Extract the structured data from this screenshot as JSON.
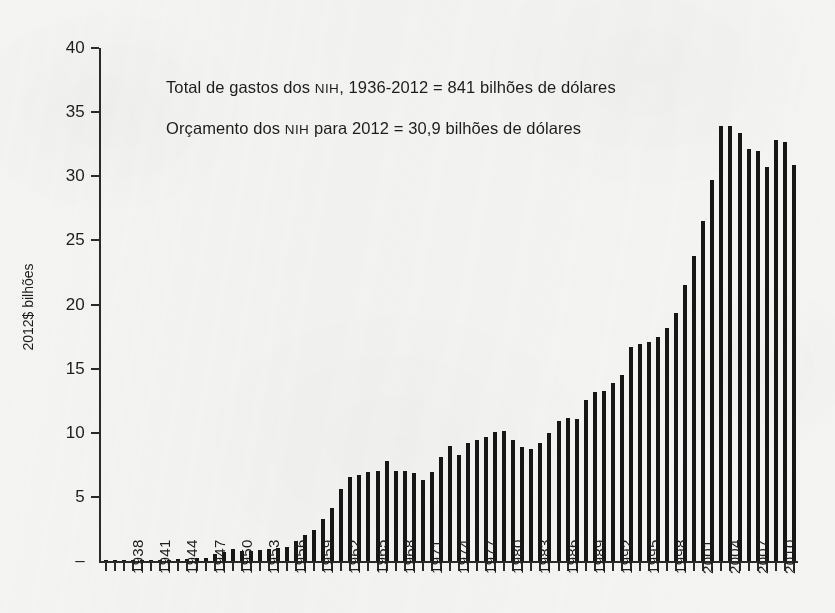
{
  "figure": {
    "background_color": "#f4f4f2",
    "ink_color": "#161616"
  },
  "annotations": {
    "total": {
      "prefix": "Total de gastos dos ",
      "acronym": "NIH",
      "suffix": ", 1936-2012 = 841 bilhões de dólares"
    },
    "budget": {
      "prefix": "Orçamento dos ",
      "acronym": "NIH",
      "suffix": " para 2012 = 30,9 bilhões de dólares"
    }
  },
  "chart_data": {
    "type": "bar",
    "title": "",
    "subtitle": "",
    "xlabel": "",
    "ylabel": "2012$ bilhões",
    "ylim": [
      0,
      40
    ],
    "ytick_values": [
      0,
      5,
      10,
      15,
      20,
      25,
      30,
      35,
      40
    ],
    "ytick_labels": [
      "–",
      "5",
      "10",
      "15",
      "20",
      "25",
      "30",
      "35",
      "40"
    ],
    "grid": false,
    "legend": null,
    "xtick_label_interval": 3,
    "xtick_labels_shown": [
      "1938",
      "1941",
      "1944",
      "1947",
      "1950",
      "1953",
      "1956",
      "1959",
      "1962",
      "1965",
      "1968",
      "1971",
      "1974",
      "1977",
      "1980",
      "1983",
      "1986",
      "1989",
      "1992",
      "1995",
      "1998",
      "2001",
      "2004",
      "2007",
      "2010"
    ],
    "categories": [
      "1936",
      "1937",
      "1938",
      "1939",
      "1940",
      "1941",
      "1942",
      "1943",
      "1944",
      "1945",
      "1946",
      "1947",
      "1948",
      "1949",
      "1950",
      "1951",
      "1952",
      "1953",
      "1954",
      "1955",
      "1956",
      "1957",
      "1958",
      "1959",
      "1960",
      "1961",
      "1962",
      "1963",
      "1964",
      "1965",
      "1966",
      "1967",
      "1968",
      "1969",
      "1970",
      "1971",
      "1972",
      "1973",
      "1974",
      "1975",
      "1976",
      "1977",
      "1978",
      "1979",
      "1980",
      "1981",
      "1982",
      "1983",
      "1984",
      "1985",
      "1986",
      "1987",
      "1988",
      "1989",
      "1990",
      "1991",
      "1992",
      "1993",
      "1994",
      "1995",
      "1996",
      "1997",
      "1998",
      "1999",
      "2000",
      "2001",
      "2002",
      "2003",
      "2004",
      "2005",
      "2006",
      "2007",
      "2008",
      "2009",
      "2010",
      "2011",
      "2012"
    ],
    "values": [
      0.02,
      0.03,
      0.05,
      0.06,
      0.07,
      0.08,
      0.09,
      0.1,
      0.12,
      0.15,
      0.2,
      0.25,
      0.55,
      0.7,
      0.9,
      0.8,
      0.8,
      0.85,
      0.9,
      1.0,
      1.1,
      1.55,
      2.05,
      2.45,
      3.25,
      4.15,
      5.6,
      6.55,
      6.7,
      6.95,
      7.05,
      7.8,
      7.0,
      7.05,
      6.9,
      6.3,
      6.95,
      8.1,
      8.95,
      8.3,
      9.2,
      9.45,
      9.7,
      10.05,
      10.1,
      9.4,
      8.85,
      8.7,
      9.2,
      9.95,
      10.95,
      11.15,
      11.1,
      12.55,
      13.15,
      13.25,
      13.85,
      14.5,
      16.7,
      16.95,
      17.05,
      17.5,
      18.2,
      19.3,
      21.5,
      23.8,
      26.5,
      29.7,
      33.9,
      33.9,
      33.4,
      32.1,
      32.0,
      30.7,
      32.8,
      32.7,
      30.9
    ],
    "notes": [
      "Total de gastos dos NIH, 1936-2012 = 841 bilhões de dólares",
      "Orçamento dos NIH para 2012 = 30,9 bilhões de dólares"
    ]
  }
}
